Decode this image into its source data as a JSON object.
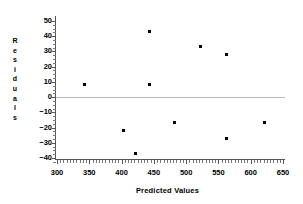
{
  "chart_data": {
    "type": "scatter",
    "title": "",
    "xlabel": "Predicted Values",
    "ylabel": "Residuals",
    "ylabel_letters": [
      "R",
      "e",
      "s",
      "i",
      "d",
      "u",
      "a",
      "l",
      "s"
    ],
    "xlim": [
      300,
      650
    ],
    "ylim": [
      -45,
      52
    ],
    "xticks": [
      300,
      350,
      400,
      450,
      500,
      550,
      600,
      650
    ],
    "yticks": [
      50,
      40,
      30,
      20,
      10,
      0,
      -10,
      -20,
      -30,
      -40
    ],
    "ytick_labels": [
      "50",
      "40",
      "30",
      "20",
      "10",
      "0",
      "-10",
      "-20",
      "-30",
      "-40"
    ],
    "xtick_labels": [
      "300",
      "350",
      "400",
      "450",
      "500",
      "550",
      "600",
      "650"
    ],
    "grid": false,
    "legend": null,
    "reference_line": {
      "value": 0,
      "orientation": "horizontal",
      "color": "#b9b9b9"
    },
    "marker": {
      "shape": "square",
      "color": "#000000",
      "size": 3
    },
    "x": [
      342,
      403,
      422,
      443,
      443,
      482,
      522,
      562,
      562,
      622
    ],
    "y": [
      8,
      -22,
      -37,
      43,
      8,
      -17,
      33,
      28,
      -27,
      -17
    ],
    "points": [
      {
        "x": 342,
        "y": 8
      },
      {
        "x": 403,
        "y": -22
      },
      {
        "x": 422,
        "y": -37
      },
      {
        "x": 443,
        "y": 43
      },
      {
        "x": 443,
        "y": 8
      },
      {
        "x": 482,
        "y": -17
      },
      {
        "x": 522,
        "y": 33
      },
      {
        "x": 562,
        "y": 28
      },
      {
        "x": 562,
        "y": -27
      },
      {
        "x": 622,
        "y": -17
      }
    ]
  },
  "axes": {
    "x_minor_tick_step": 5,
    "y_minor_tick_step": 2.5,
    "spine_color": "#555555"
  }
}
